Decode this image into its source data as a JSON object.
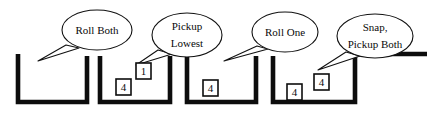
{
  "diagram": {
    "background_color": "#ffffff",
    "line_color": "#0d0d0d",
    "text_color": "#0a0a0a",
    "callouts": [
      {
        "id": "callout-roll-both",
        "lines": [
          "Roll Both"
        ],
        "cx": 97,
        "cy": 30,
        "rx": 35,
        "ry": 20,
        "tail": "M 66,45 L 38,61 L 79,48 Z"
      },
      {
        "id": "callout-pickup-lowest",
        "lines": [
          "Pickup",
          "Lowest"
        ],
        "cx": 187,
        "cy": 35,
        "rx": 35,
        "ry": 22,
        "tail": "M 158,50 L 136,65 L 172,54 Z"
      },
      {
        "id": "callout-roll-one",
        "lines": [
          "Roll One"
        ],
        "cx": 285,
        "cy": 32,
        "rx": 33,
        "ry": 20,
        "tail": "M 257,46 L 224,61 L 268,49 Z"
      },
      {
        "id": "callout-snap-pickup-both",
        "lines": [
          "Snap,",
          "Pickup Both"
        ],
        "cx": 375,
        "cy": 36,
        "rx": 38,
        "ry": 22,
        "tail": "M 346,52 L 318,70 L 360,56 Z"
      }
    ],
    "waveform": {
      "description": "Square wave with four low pulses (U shaped troughs)",
      "high_level_y": 54,
      "low_level_y": 102,
      "path": "M 18,54 L 18,102 L 87,102 L 87,56 M 100,56 L 100,102 L 170,102 L 170,56 M 187,56 L 187,102 L 256,102 L 256,56 M 273,56 L 273,102 L 355,102 L 355,54 L 427,54",
      "segments": [
        {
          "id": "trough-1",
          "start_x": 18,
          "end_x": 87
        },
        {
          "id": "trough-2",
          "start_x": 100,
          "end_x": 170
        },
        {
          "id": "trough-3",
          "start_x": 187,
          "end_x": 256
        },
        {
          "id": "trough-4",
          "start_x": 273,
          "end_x": 355
        }
      ]
    },
    "duration_labels": [
      {
        "id": "duration-label-1",
        "value": "4",
        "x": 116,
        "y": 79,
        "w": 15,
        "h": 16
      },
      {
        "id": "duration-label-2",
        "value": "1",
        "x": 136,
        "y": 63,
        "w": 15,
        "h": 16
      },
      {
        "id": "duration-label-3",
        "value": "4",
        "x": 203,
        "y": 80,
        "w": 15,
        "h": 16
      },
      {
        "id": "duration-label-4",
        "value": "4",
        "x": 287,
        "y": 84,
        "w": 15,
        "h": 16
      },
      {
        "id": "duration-label-5",
        "value": "4",
        "x": 314,
        "y": 74,
        "w": 15,
        "h": 16
      }
    ]
  }
}
